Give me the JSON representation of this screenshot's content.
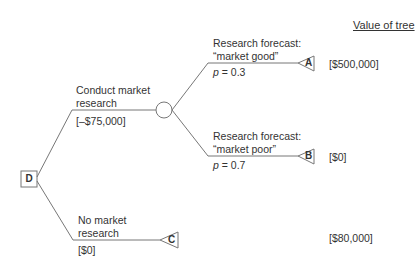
{
  "header": {
    "value_of_tree": "Value of tree"
  },
  "decision_node": {
    "label": "D"
  },
  "branches": {
    "conduct": {
      "line1": "Conduct market",
      "line2": "research",
      "cost": "[–$75,000]"
    },
    "no_research": {
      "line1": "No market",
      "line2": "research",
      "cost": "[$0]"
    },
    "good": {
      "line1": "Research forecast:",
      "line2": "“market good”",
      "prob_p": "p",
      "prob_rest": " = 0.3"
    },
    "poor": {
      "line1": "Research forecast:",
      "line2": "“market poor”",
      "prob_p": "p",
      "prob_rest": " = 0.7"
    }
  },
  "terminals": [
    {
      "label": "A",
      "value": "[$500,000]"
    },
    {
      "label": "B",
      "value": "[$0]"
    },
    {
      "label": "C",
      "value": "[$80,000]"
    }
  ],
  "colors": {
    "line": "#7a7a7a",
    "text": "#333333"
  }
}
